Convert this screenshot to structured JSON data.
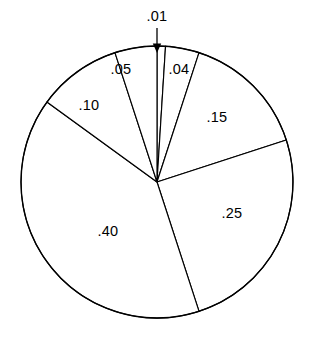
{
  "chart_data": {
    "type": "pie",
    "title": "",
    "xlabel": "",
    "ylabel": "",
    "grid": false,
    "legend": "none",
    "start_angle_deg": 0,
    "direction": "clockwise",
    "total": 1.0,
    "labels": [
      ".01",
      ".04",
      ".15",
      ".25",
      ".40",
      ".10",
      ".05"
    ],
    "values": [
      0.01,
      0.04,
      0.15,
      0.25,
      0.4,
      0.1,
      0.05
    ],
    "slices": [
      {
        "label": ".01",
        "value": 0.01,
        "label_placement": "outside",
        "has_leader_arrow": true,
        "label_x": 157,
        "label_y": 17
      },
      {
        "label": ".04",
        "value": 0.04,
        "label_placement": "inside",
        "has_leader_arrow": false,
        "label_x": 179,
        "label_y": 70
      },
      {
        "label": ".15",
        "value": 0.15,
        "label_placement": "inside",
        "has_leader_arrow": false,
        "label_x": 217,
        "label_y": 118
      },
      {
        "label": ".25",
        "value": 0.25,
        "label_placement": "inside",
        "has_leader_arrow": false,
        "label_x": 232,
        "label_y": 214
      },
      {
        "label": ".40",
        "value": 0.4,
        "label_placement": "inside",
        "has_leader_arrow": false,
        "label_x": 108,
        "label_y": 232
      },
      {
        "label": ".10",
        "value": 0.1,
        "label_placement": "inside",
        "has_leader_arrow": false,
        "label_x": 89,
        "label_y": 106
      },
      {
        "label": ".05",
        "value": 0.05,
        "label_placement": "inside",
        "has_leader_arrow": false,
        "label_x": 121,
        "label_y": 70
      }
    ],
    "geometry": {
      "center_x": 157,
      "center_y": 182,
      "radius": 136,
      "arrow_tip_x": 157,
      "arrow_tip_y": 53,
      "arrow_tail_y": 28
    },
    "colors": {
      "slice_fill": "#ffffff",
      "stroke": "#000000",
      "background": "#ffffff",
      "label": "#000000"
    }
  }
}
